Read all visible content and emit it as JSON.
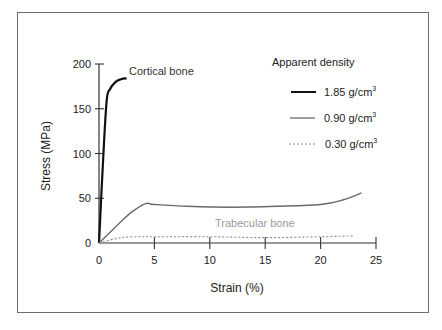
{
  "chart_data": {
    "type": "line",
    "title": "",
    "xlabel": "Strain (%)",
    "ylabel": "Stress (MPa)",
    "xlim": [
      0,
      25
    ],
    "ylim": [
      0,
      200
    ],
    "xticks": [
      "0",
      "5",
      "10",
      "15",
      "20",
      "25"
    ],
    "yticks": [
      "0",
      "50",
      "100",
      "150",
      "200"
    ],
    "grid": false,
    "legend": {
      "title": "Apparent density",
      "position": "upper right",
      "entries": [
        {
          "label": "1.85 g/cm",
          "sup": "3",
          "style": "solid-thick",
          "color": "#111111"
        },
        {
          "label": "0.90 g/cm",
          "sup": "3",
          "style": "solid",
          "color": "#6a6a6a"
        },
        {
          "label": "0.30 g/cm",
          "sup": "3",
          "style": "dotted",
          "color": "#8a8a8a"
        }
      ]
    },
    "annotations": [
      {
        "text": "Cortical bone",
        "x": 2.8,
        "y": 190,
        "color": "#333333"
      },
      {
        "text": "Trabecular bone",
        "x": 16,
        "y": 20,
        "color": "#9a9a9a"
      }
    ],
    "series": [
      {
        "name": "1.85 g/cm3",
        "x": [
          0,
          0.4,
          0.7,
          1.0,
          1.5,
          2.0,
          2.5
        ],
        "y": [
          0,
          100,
          160,
          172,
          180,
          183,
          184
        ]
      },
      {
        "name": "0.90 g/cm3",
        "x": [
          0,
          1,
          2,
          3,
          4.2,
          5,
          8,
          12,
          16,
          20,
          22,
          23.7
        ],
        "y": [
          0,
          12,
          24,
          35,
          44,
          43,
          41,
          40,
          41,
          43,
          48,
          56
        ]
      },
      {
        "name": "0.30 g/cm3",
        "x": [
          0,
          2,
          4,
          5,
          10,
          15,
          20,
          23
        ],
        "y": [
          0,
          6,
          7,
          7,
          7,
          6,
          7,
          8
        ]
      }
    ]
  }
}
